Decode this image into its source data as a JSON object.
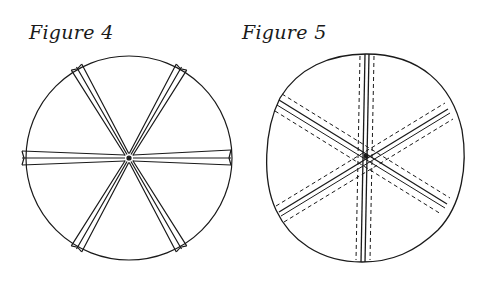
{
  "figures": [
    {
      "caption": "Figure 4",
      "description": "Circle with three crossing folded strips forming six spokes through the center",
      "center": [
        129,
        158
      ],
      "radius": 103,
      "strip_angles_deg": [
        0,
        60,
        120
      ]
    },
    {
      "caption": "Figure 5",
      "description": "Circle with six seam lines radiating from center, each flanked by dashed stitching",
      "center": [
        366,
        155
      ],
      "radius": 98,
      "seam_angles_deg": [
        90,
        30,
        150
      ]
    }
  ],
  "colors": {
    "ink": "#1a1a1a",
    "background": "#ffffff"
  }
}
